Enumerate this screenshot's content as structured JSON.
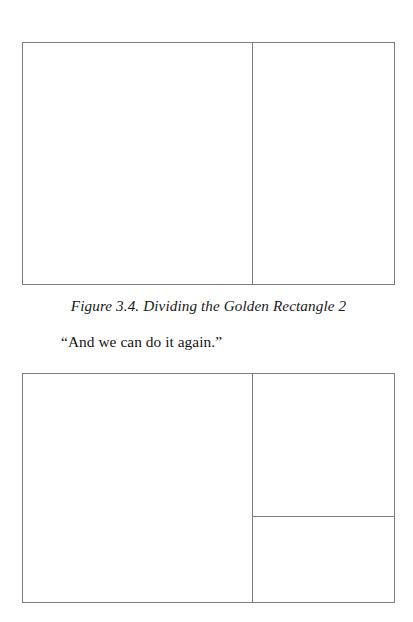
{
  "page": {
    "background_color": "#ffffff",
    "line_color": "#7c7c7c",
    "width": 413,
    "height": 622
  },
  "figures": [
    {
      "id": "figure-3-4-golden-rectangle-2",
      "alt": "Golden rectangle divided by one vertical line into a square and a smaller golden rectangle",
      "subdivisions": 1
    },
    {
      "id": "figure-golden-rectangle-3",
      "alt": "Golden rectangle divided by a vertical line and a horizontal line in the right column into a square, a square and a smaller golden rectangle",
      "subdivisions": 2
    }
  ],
  "caption": {
    "text": "Figure 3.4. Dividing the Golden Rectangle 2"
  },
  "body": {
    "quote": "“And we can do it again.”"
  }
}
